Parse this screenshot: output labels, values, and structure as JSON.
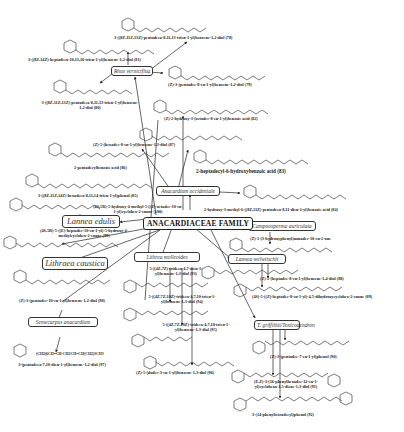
{
  "diagram": {
    "title": "ANACARDIACEAE FAMILY",
    "species": [
      {
        "id": "rhus-verniciflua",
        "label": "Rhus verniciflua"
      },
      {
        "id": "anacardium-occidentale",
        "label": "Anacardium occidentale"
      },
      {
        "id": "lannea-edulis",
        "label": "Lannea edulis"
      },
      {
        "id": "lithraea-caustica",
        "label": "Lithraea caustica"
      },
      {
        "id": "semecarpus-anacardium",
        "label": "Semecarpus anacardium"
      },
      {
        "id": "lithrea-molleoides",
        "label": "Lithrea molleoides"
      },
      {
        "id": "campnosperma-auriculata",
        "label": "Campnosperma auriculata"
      },
      {
        "id": "lannea-welwitschii",
        "label": "Lannea welwitschii"
      },
      {
        "id": "toxicodendron",
        "label": "T. griffithii/Toxicodendron"
      }
    ],
    "compounds": [
      {
        "id": "c78",
        "name": "3-((8Z,11Z,13Z)-pentadeca-8,11,13-trien-1-yl)benzene-1,2-diol (78)"
      },
      {
        "id": "c81",
        "name": "3-((8Z,14Z)-heptadeca-10,13,16-trien-1-yl)benzene-1,2-diol (81)"
      },
      {
        "id": "c79",
        "name": "(Z)-3-(pentadec-8-en-1-yl)benzene-1,2-diol (79)"
      },
      {
        "id": "c80",
        "name": "3-((8Z,11Z,13Z)-pentadeca-8,11,13-trien-1-yl)benzene-1,2-diol (80)"
      },
      {
        "id": "c82",
        "name": "(Z)-2-hydroxy-3-(octadec-8-en-1-yl)benzoic acid (82)"
      },
      {
        "id": "c87",
        "name": "(Z)-5-(hexadec-8-en-1-yl)benzene-1,3-diol (87)"
      },
      {
        "id": "c86",
        "name": "2-pentadecylbenzoic acid (86)"
      },
      {
        "id": "c83",
        "name": "2-heptadecyl-6-hydroxybenzoic acid (83)"
      },
      {
        "id": "c85",
        "name": "3-((8Z,11Z,14Z)-hexadeca-8,11,14-trien-1-yl)phenol (85)"
      },
      {
        "id": "c84",
        "name": "2-hydroxy-3-methyl-6-((8Z,11Z)-pentadeca-8,11-dien-1-yl)benzoic acid (84)"
      },
      {
        "id": "c100",
        "name": "(4S,5R)-5-hydroxy-4-methyl-5-((Z)-octadec-10-en-1-yl)cyclohex-2-enone (100)"
      },
      {
        "id": "c99",
        "name": "(4S,5R)-5-((E)-heptadec-10-en-1-yl)-5-hydroxy-4-methylcyclohex-2-enone (99)"
      },
      {
        "id": "c98",
        "name": "(Z)-3-(pentadec-10-en-1-yl)benzene-1,2-diol (98)"
      },
      {
        "id": "c97",
        "name": "3-(pentadeca-7,10-dien-1-yl)benzene-1,2-diol (97)"
      },
      {
        "id": "c93",
        "name": "5-((4Z,7Z)-trideca-4,7-dien-1-yl)benzene-1,3-diol (93)"
      },
      {
        "id": "c94",
        "name": "5-((4Z,7Z,10Z)-trideca-4,7,10-trien-1-yl)benzene-1,3-diol (94)"
      },
      {
        "id": "c95",
        "name": "5-((4Z,7Z,10Z)-trideca-4,7,10-trien-1-yl)benzene-1,3-diol (95)"
      },
      {
        "id": "c96",
        "name": "(Z)-5-(dodec-3-en-1-yl)benzene-1,3-diol (96)"
      },
      {
        "id": "c101",
        "name": "(Z)-1-(3-hydroxyphenyl)nonadec-10-en-2-one"
      },
      {
        "id": "c88",
        "name": "(Z)-2-(heptadec-8-en-1-yl)benzene-1,4-diol (88)"
      },
      {
        "id": "c89",
        "name": "(4S)-5-((Z)-heptadec-8-en-1-yl)-4,5-dihydroxycyclohex-2-enone (89)"
      },
      {
        "id": "c90",
        "name": "(Z)-3-(pentadec-7-en-1-yl)phenol (90)"
      },
      {
        "id": "c91",
        "name": "(E,Z)-3-(16-phenylhexadec-12-en-1-yl)cyclohexa-1,5-diene-1,3-diol (91)"
      },
      {
        "id": "c92",
        "name": "3-(14-phenyltetradecyl)phenol (92)"
      }
    ],
    "formula_text": "(CH2)6CH=CH-CH2CH=CH(CH2)3CH3",
    "substituent_labels": {
      "oh": "OH",
      "ho": "HO",
      "cooh": "COOH",
      "h": "H",
      "o": "O"
    }
  }
}
